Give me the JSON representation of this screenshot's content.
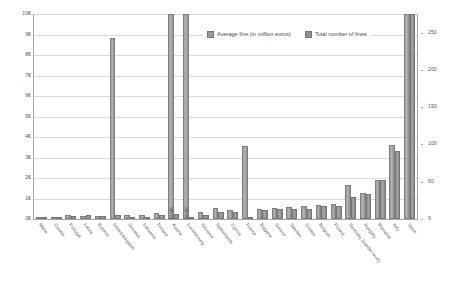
{
  "chart_data": {
    "type": "bar",
    "title": "",
    "subtitle": "",
    "xlabel": "",
    "ylabel_left": "Average fine (in million euros)",
    "ylabel_right": "Total number of fines",
    "grid": true,
    "legend_position": "top-center",
    "categories": [
      "Malta",
      "Croatia",
      "Portugal",
      "Latvia",
      "Estonia",
      "United Kingdom",
      "Slovakia",
      "Lithuania",
      "Finland",
      "Austria",
      "Luxembourg",
      "Slovenia",
      "Netherlands",
      "Cyprus",
      "France",
      "Bulgaria",
      "Greece",
      "Sweden",
      "Croatia",
      "Belgium",
      "Poland",
      "Germany (Länder level)",
      "Hungary",
      "Romania",
      "Italy",
      "Spain"
    ],
    "left_axis": {
      "ticks": [
        "0€",
        "1€",
        "2€",
        "3€",
        "4€",
        "5€",
        "6€",
        "7€",
        "8€",
        "9€",
        "10€"
      ],
      "min": 0,
      "max": 10,
      "unit": "million euros"
    },
    "right_axis": {
      "ticks": [
        "0",
        "50",
        "100",
        "150",
        "200",
        "250"
      ],
      "min": 0,
      "max": 275,
      "unit": "count"
    },
    "series": [
      {
        "name": "Average fine (in million euros)",
        "axis": "left",
        "color": "#9a9a9a",
        "values": [
          0.05,
          0.12,
          0.18,
          0.15,
          0.17,
          8.85,
          0.22,
          0.2,
          0.3,
          10.0,
          10.0,
          0.35,
          0.55,
          0.45,
          3.55,
          0.5,
          0.55,
          0.6,
          0.62,
          0.7,
          0.75,
          1.65,
          1.25,
          1.9,
          3.6,
          10.0
        ],
        "labels": [
          "",
          "",
          "",
          "",
          "",
          "",
          "",
          "",
          "",
          "22.5M",
          "20.6M",
          "",
          "",
          "",
          "",
          "",
          "",
          "",
          "",
          "",
          "",
          "",
          "",
          "",
          "",
          ""
        ]
      },
      {
        "name": "Total number of fines",
        "axis": "right",
        "color": "#8e8e8e",
        "values": [
          1,
          2,
          4,
          5,
          4,
          6,
          2,
          3,
          5,
          7,
          2,
          6,
          9,
          10,
          2,
          12,
          14,
          13,
          13,
          17,
          18,
          29,
          33,
          52,
          91,
          276
        ],
        "labels": [
          "",
          "",
          "",
          "",
          "",
          "",
          "",
          "",
          "",
          "",
          "",
          "",
          "",
          "",
          "",
          "",
          "",
          "",
          "",
          "",
          "",
          "",
          "",
          "",
          "",
          ""
        ]
      }
    ]
  },
  "legend": {
    "items": [
      {
        "label": "Average fine (in million euros)"
      },
      {
        "label": "Total number of fines"
      }
    ]
  }
}
